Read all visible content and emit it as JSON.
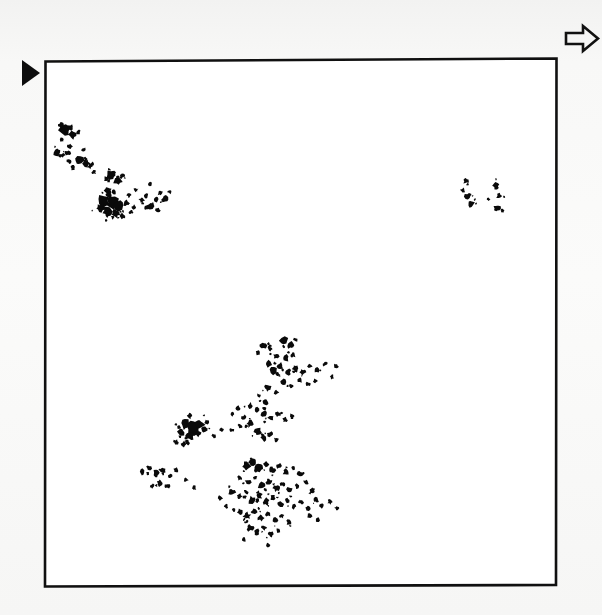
{
  "figure": {
    "background_color": "#f7f7f6",
    "ink_color": "#0a0a0a",
    "frame_fill": "#ffffff",
    "frame_stroke": "#101010",
    "caption": "",
    "title": ""
  },
  "markers": {
    "left_marker": {
      "name": "solid-right-triangle-marker",
      "shape": "filled-triangle-right",
      "x": 22,
      "y": 60,
      "width": 18,
      "height": 26,
      "color": "#0d0d0d"
    },
    "top_right_marker": {
      "name": "hollow-block-arrow-marker",
      "shape": "outlined-block-arrow-right",
      "x": 565,
      "y": 26,
      "width": 33,
      "height": 25,
      "color": "#111111"
    }
  },
  "plot_frame": {
    "left": 45,
    "top": 59,
    "right": 556,
    "bottom": 586,
    "skew_note": "scanned page, borders slightly rotated",
    "corners": [
      [
        45.5,
        61.5
      ],
      [
        556.5,
        58.5
      ],
      [
        556.0,
        585.0
      ],
      [
        45.0,
        586.5
      ]
    ]
  },
  "chart_data": {
    "type": "scatter",
    "title": "",
    "xlabel": "",
    "ylabel": "",
    "xlim": [
      45,
      556
    ],
    "ylim": [
      59,
      586
    ],
    "grid": false,
    "legend": null,
    "tick_labels": {
      "x": [],
      "y": []
    },
    "annotations": [],
    "clusters": [
      {
        "name": "upper-left-cluster",
        "centroid": [
          108,
          185
        ],
        "extent": [
          48,
          125,
          180,
          245
        ],
        "point_count": 41
      },
      {
        "name": "upper-right-cluster",
        "centroid": [
          484,
          198
        ],
        "extent": [
          459,
          176,
          505,
          222
        ],
        "point_count": 7
      },
      {
        "name": "lower-center-cluster",
        "centroid": [
          245,
          450
        ],
        "extent": [
          133,
          336,
          345,
          553
        ],
        "point_count": 96
      }
    ],
    "series": [
      {
        "name": "upper-left-cluster",
        "color": "#0a0a0a",
        "points": [
          [
            65,
            131,
            5.0
          ],
          [
            72,
            135,
            3.6
          ],
          [
            78,
            132,
            2.2
          ],
          [
            62,
            140,
            2.0
          ],
          [
            70,
            146,
            2.4
          ],
          [
            57,
            152,
            3.4
          ],
          [
            63,
            155,
            2.0
          ],
          [
            68,
            153,
            2.6
          ],
          [
            84,
            150,
            2.0
          ],
          [
            79,
            160,
            4.2
          ],
          [
            86,
            163,
            3.4
          ],
          [
            90,
            166,
            2.4
          ],
          [
            73,
            168,
            2.2
          ],
          [
            94,
            172,
            2.0
          ],
          [
            106,
            179,
            2.2
          ],
          [
            112,
            175,
            4.6
          ],
          [
            118,
            181,
            4.0
          ],
          [
            122,
            176,
            2.6
          ],
          [
            108,
            190,
            3.2
          ],
          [
            114,
            192,
            2.0
          ],
          [
            104,
            200,
            5.4
          ],
          [
            112,
            203,
            5.8
          ],
          [
            119,
            206,
            4.4
          ],
          [
            126,
            203,
            3.0
          ],
          [
            100,
            208,
            3.6
          ],
          [
            108,
            212,
            4.2
          ],
          [
            116,
            214,
            3.4
          ],
          [
            123,
            216,
            2.6
          ],
          [
            131,
            212,
            2.2
          ],
          [
            134,
            207,
            2.0
          ],
          [
            129,
            195,
            2.4
          ],
          [
            136,
            190,
            2.0
          ],
          [
            142,
            200,
            2.6
          ],
          [
            146,
            196,
            2.2
          ],
          [
            150,
            206,
            3.2
          ],
          [
            156,
            200,
            2.6
          ],
          [
            160,
            193,
            2.4
          ],
          [
            165,
            199,
            3.0
          ],
          [
            170,
            192,
            2.0
          ],
          [
            158,
            210,
            2.2
          ],
          [
            150,
            184,
            2.0
          ]
        ]
      },
      {
        "name": "upper-right-cluster",
        "color": "#0a0a0a",
        "points": [
          [
            466,
            181,
            2.6
          ],
          [
            463,
            190,
            2.2
          ],
          [
            468,
            196,
            3.0
          ],
          [
            471,
            204,
            3.4
          ],
          [
            488,
            199,
            1.8
          ],
          [
            496,
            186,
            3.0
          ],
          [
            499,
            196,
            2.6
          ],
          [
            497,
            208,
            3.2
          ]
        ]
      },
      {
        "name": "lower-center-cluster",
        "color": "#0a0a0a",
        "points": [
          [
            263,
            345,
            3.4
          ],
          [
            270,
            349,
            2.4
          ],
          [
            258,
            353,
            2.2
          ],
          [
            284,
            341,
            3.6
          ],
          [
            291,
            345,
            3.0
          ],
          [
            296,
            340,
            2.2
          ],
          [
            276,
            356,
            2.6
          ],
          [
            286,
            358,
            3.2
          ],
          [
            293,
            355,
            2.4
          ],
          [
            268,
            364,
            3.0
          ],
          [
            274,
            370,
            4.2
          ],
          [
            280,
            366,
            3.0
          ],
          [
            288,
            372,
            3.4
          ],
          [
            296,
            368,
            2.8
          ],
          [
            303,
            372,
            3.0
          ],
          [
            310,
            366,
            2.4
          ],
          [
            317,
            370,
            2.6
          ],
          [
            325,
            364,
            2.2
          ],
          [
            336,
            366,
            2.0
          ],
          [
            332,
            377,
            2.0
          ],
          [
            300,
            380,
            2.4
          ],
          [
            308,
            384,
            2.0
          ],
          [
            315,
            381,
            2.2
          ],
          [
            283,
            382,
            2.6
          ],
          [
            291,
            386,
            2.0
          ],
          [
            268,
            388,
            3.0
          ],
          [
            276,
            392,
            2.4
          ],
          [
            259,
            396,
            2.2
          ],
          [
            266,
            402,
            2.6
          ],
          [
            250,
            406,
            3.0
          ],
          [
            257,
            410,
            2.4
          ],
          [
            264,
            414,
            3.6
          ],
          [
            271,
            418,
            3.0
          ],
          [
            278,
            414,
            2.6
          ],
          [
            285,
            420,
            2.4
          ],
          [
            292,
            416,
            2.2
          ],
          [
            244,
            418,
            2.6
          ],
          [
            250,
            424,
            3.2
          ],
          [
            232,
            414,
            2.0
          ],
          [
            238,
            408,
            2.2
          ],
          [
            186,
            424,
            5.0
          ],
          [
            193,
            428,
            5.6
          ],
          [
            200,
            424,
            4.2
          ],
          [
            181,
            432,
            3.6
          ],
          [
            190,
            436,
            4.0
          ],
          [
            198,
            434,
            3.0
          ],
          [
            205,
            430,
            2.6
          ],
          [
            207,
            422,
            2.2
          ],
          [
            214,
            436,
            2.0
          ],
          [
            222,
            430,
            2.2
          ],
          [
            232,
            430,
            2.0
          ],
          [
            240,
            426,
            2.2
          ],
          [
            176,
            442,
            2.4
          ],
          [
            184,
            444,
            2.6
          ],
          [
            258,
            432,
            3.4
          ],
          [
            264,
            438,
            3.0
          ],
          [
            270,
            434,
            2.4
          ],
          [
            276,
            440,
            2.2
          ],
          [
            142,
            472,
            2.8
          ],
          [
            149,
            468,
            2.4
          ],
          [
            156,
            474,
            3.2
          ],
          [
            163,
            470,
            2.6
          ],
          [
            170,
            476,
            2.4
          ],
          [
            176,
            470,
            2.2
          ],
          [
            160,
            483,
            3.0
          ],
          [
            167,
            486,
            2.4
          ],
          [
            152,
            486,
            2.0
          ],
          [
            186,
            480,
            2.0
          ],
          [
            194,
            488,
            2.2
          ],
          [
            246,
            466,
            3.8
          ],
          [
            253,
            462,
            3.0
          ],
          [
            259,
            468,
            3.4
          ],
          [
            266,
            464,
            2.6
          ],
          [
            272,
            470,
            3.0
          ],
          [
            279,
            466,
            2.4
          ],
          [
            286,
            472,
            2.8
          ],
          [
            293,
            468,
            2.2
          ],
          [
            300,
            474,
            2.6
          ],
          [
            240,
            478,
            2.4
          ],
          [
            248,
            482,
            3.0
          ],
          [
            255,
            478,
            2.2
          ],
          [
            262,
            486,
            3.4
          ],
          [
            269,
            482,
            2.6
          ],
          [
            276,
            488,
            3.0
          ],
          [
            283,
            484,
            2.4
          ],
          [
            290,
            490,
            2.8
          ],
          [
            297,
            486,
            2.2
          ],
          [
            306,
            482,
            2.4
          ],
          [
            312,
            490,
            2.6
          ],
          [
            232,
            492,
            3.0
          ],
          [
            239,
            496,
            2.4
          ],
          [
            246,
            492,
            2.2
          ],
          [
            252,
            500,
            3.6
          ],
          [
            259,
            496,
            3.0
          ],
          [
            266,
            502,
            3.4
          ],
          [
            273,
            498,
            2.6
          ],
          [
            280,
            504,
            3.0
          ],
          [
            287,
            500,
            2.4
          ],
          [
            294,
            506,
            2.6
          ],
          [
            301,
            502,
            2.2
          ],
          [
            308,
            508,
            2.4
          ],
          [
            316,
            500,
            2.6
          ],
          [
            322,
            506,
            2.2
          ],
          [
            330,
            502,
            2.4
          ],
          [
            337,
            508,
            2.0
          ],
          [
            240,
            512,
            3.0
          ],
          [
            247,
            516,
            3.4
          ],
          [
            254,
            512,
            2.6
          ],
          [
            261,
            518,
            3.0
          ],
          [
            268,
            514,
            2.4
          ],
          [
            275,
            520,
            2.8
          ],
          [
            282,
            516,
            2.2
          ],
          [
            289,
            522,
            2.6
          ],
          [
            250,
            528,
            3.2
          ],
          [
            257,
            532,
            2.6
          ],
          [
            264,
            528,
            2.4
          ],
          [
            271,
            534,
            2.8
          ],
          [
            278,
            530,
            2.2
          ],
          [
            268,
            545,
            2.0
          ],
          [
            244,
            540,
            2.2
          ],
          [
            310,
            516,
            2.4
          ],
          [
            318,
            520,
            2.0
          ],
          [
            226,
            506,
            2.0
          ],
          [
            220,
            498,
            2.2
          ]
        ]
      }
    ]
  }
}
